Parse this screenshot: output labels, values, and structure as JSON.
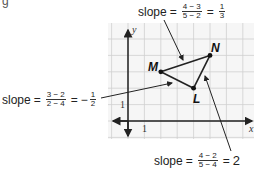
{
  "figure": {
    "points": [
      {
        "name": "M",
        "x": 2,
        "y": 3
      },
      {
        "name": "N",
        "x": 5,
        "y": 4
      },
      {
        "name": "L",
        "x": 4,
        "y": 2
      }
    ],
    "axes": {
      "x_label": "x",
      "y_label": "y",
      "x_tick": "1",
      "y_tick": "1"
    }
  },
  "annotations": {
    "slope_mn": {
      "word": "slope",
      "num": "4 − 3",
      "den": "5 − 2",
      "eq": "=",
      "result_num": "1",
      "result_den": "3"
    },
    "slope_ml": {
      "word": "slope",
      "num": "3 − 2",
      "den": "2 − 4",
      "eq": "=",
      "result_sign": "−",
      "result_num": "1",
      "result_den": "2"
    },
    "slope_ln": {
      "word": "slope",
      "num": "4 − 2",
      "den": "5 − 4",
      "eq": "=",
      "result": "2"
    }
  },
  "labels": {
    "M": "M",
    "N": "N",
    "L": "L"
  }
}
